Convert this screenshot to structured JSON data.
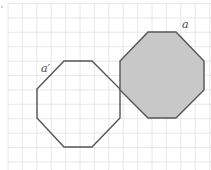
{
  "diagram": {
    "width": 211,
    "height": 170,
    "grid": {
      "origin_x": 8,
      "origin_y": 3.5,
      "spacing": 14.4,
      "color": "#e2e2e2"
    },
    "shapes": [
      {
        "id": "a-prime",
        "type": "octagon",
        "label": "a′",
        "filled": false,
        "fill": "none",
        "stroke": "#555555",
        "points": [
          [
            64,
            61
          ],
          [
            92,
            61
          ],
          [
            120,
            89
          ],
          [
            120,
            118
          ],
          [
            92,
            147
          ],
          [
            64,
            147
          ],
          [
            37,
            118
          ],
          [
            37,
            89
          ]
        ],
        "label_pos": [
          41,
          72
        ]
      },
      {
        "id": "a",
        "type": "octagon",
        "label": "a",
        "filled": true,
        "fill": "#c8c8c8",
        "stroke": "#555555",
        "points": [
          [
            148,
            32
          ],
          [
            176,
            32
          ],
          [
            204,
            61
          ],
          [
            204,
            90
          ],
          [
            176,
            118
          ],
          [
            148,
            118
          ],
          [
            120,
            90
          ],
          [
            120,
            61
          ]
        ],
        "label_pos": [
          182,
          28
        ]
      }
    ],
    "stray_mark": [
      2,
      7
    ]
  }
}
